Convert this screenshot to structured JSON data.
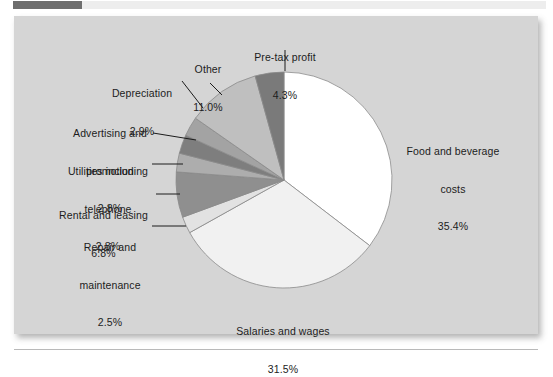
{
  "figure": {
    "background_color": "#d5d5d5",
    "page_color": "#ffffff",
    "tab_color": "#6e6e6e",
    "tab_strip_color": "#ededed",
    "rule_color": "#b9b9b9"
  },
  "chart_data": {
    "type": "pie",
    "title": "",
    "subtitle": "",
    "xlabel": "",
    "ylabel": "",
    "legend_position": "none",
    "grid": false,
    "units": "percent",
    "start_angle_deg": 0,
    "direction": "clockwise",
    "total": 100.0,
    "categories": [
      "Food and beverage costs",
      "Salaries and wages",
      "Repair and maintenance",
      "Rental and leasing",
      "Utilities including telephone",
      "Advertising and promotion",
      "Depreciation",
      "Other",
      "Pre-tax profit"
    ],
    "values": [
      35.4,
      31.5,
      2.5,
      6.8,
      2.8,
      2.8,
      2.9,
      11.0,
      4.3
    ],
    "colors": [
      "#ffffff",
      "#f1f1f1",
      "#e2e2e2",
      "#8f8f8f",
      "#adadad",
      "#7e7e7e",
      "#a3a3a3",
      "#bfbfbf",
      "#7a7a7a"
    ],
    "slices": [
      {
        "label": "Food and beverage costs",
        "value": 35.4,
        "value_label": "35.4%",
        "label_line1": "Food and beverage",
        "label_line2": "costs",
        "color": "#ffffff",
        "leader": false
      },
      {
        "label": "Salaries and wages",
        "value": 31.5,
        "value_label": "31.5%",
        "label_line1": "Salaries and wages",
        "label_line2": "",
        "color": "#f1f1f1",
        "leader": false
      },
      {
        "label": "Repair and maintenance",
        "value": 2.5,
        "value_label": "2.5%",
        "label_line1": "Repair and",
        "label_line2": "maintenance",
        "color": "#e2e2e2",
        "leader": true
      },
      {
        "label": "Rental and leasing",
        "value": 6.8,
        "value_label": "6.8%",
        "label_line1": "Rental and leasing",
        "label_line2": "",
        "color": "#8f8f8f",
        "leader": true
      },
      {
        "label": "Utilities including telephone",
        "value": 2.8,
        "value_label": "2.8%",
        "label_line1": "Utilities including",
        "label_line2": "telephone",
        "color": "#adadad",
        "leader": true
      },
      {
        "label": "Advertising and promotion",
        "value": 2.8,
        "value_label": "2.8%",
        "label_line1": "Advertising and",
        "label_line2": "promotion",
        "color": "#7e7e7e",
        "leader": true
      },
      {
        "label": "Depreciation",
        "value": 2.9,
        "value_label": "2.9%",
        "label_line1": "Depreciation",
        "label_line2": "",
        "color": "#a3a3a3",
        "leader": true
      },
      {
        "label": "Other",
        "value": 11.0,
        "value_label": "11.0%",
        "label_line1": "Other",
        "label_line2": "",
        "color": "#bfbfbf",
        "leader": true
      },
      {
        "label": "Pre-tax profit",
        "value": 4.3,
        "value_label": "4.3%",
        "label_line1": "Pre-tax profit",
        "label_line2": "",
        "color": "#7a7a7a",
        "leader": true
      }
    ]
  },
  "labels": {
    "food": {
      "line1": "Food and beverage",
      "line2": "costs",
      "pct": "35.4%"
    },
    "salaries": {
      "line1": "Salaries and wages",
      "pct": "31.5%"
    },
    "repair": {
      "line1": "Repair and",
      "line2": "maintenance",
      "pct": "2.5%"
    },
    "rental": {
      "line1": "Rental and leasing",
      "pct": "6.8%"
    },
    "utilities": {
      "line1": "Utilities including",
      "line2": "telephone",
      "pct": "2.8%"
    },
    "advertising": {
      "line1": "Advertising and",
      "line2": "promotion",
      "pct": "2.8%"
    },
    "depreciation": {
      "line1": "Depreciation",
      "pct": "2.9%"
    },
    "other": {
      "line1": "Other",
      "pct": "11.0%"
    },
    "pretax": {
      "line1": "Pre-tax profit",
      "pct": "4.3%"
    }
  }
}
